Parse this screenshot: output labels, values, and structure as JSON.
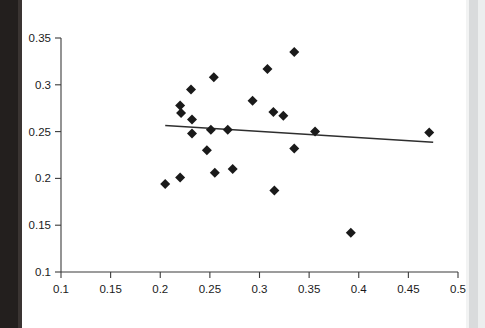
{
  "chart_data": {
    "type": "scatter",
    "title": "",
    "subtitle": "",
    "xlabel": "",
    "ylabel": "",
    "xlim": [
      0.1,
      0.5
    ],
    "ylim": [
      0.1,
      0.35
    ],
    "grid": false,
    "legend": null,
    "marker_shape": "diamond",
    "marker_color": "#1a1a1a",
    "trendline_color": "#2e2e2e",
    "xticks": [
      0.1,
      0.15,
      0.2,
      0.25,
      0.3,
      0.35,
      0.4,
      0.45,
      0.5
    ],
    "yticks": [
      0.1,
      0.15,
      0.2,
      0.25,
      0.3,
      0.35
    ],
    "xtick_labels": [
      "0.1",
      "0.15",
      "0.2",
      "0.25",
      "0.3",
      "0.35",
      "0.4",
      "0.45",
      "0.5"
    ],
    "ytick_labels": [
      "0.1",
      "0.15",
      "0.2",
      "0.25",
      "0.3",
      "0.35"
    ],
    "points": [
      {
        "x": 0.205,
        "y": 0.194
      },
      {
        "x": 0.22,
        "y": 0.201
      },
      {
        "x": 0.22,
        "y": 0.278
      },
      {
        "x": 0.221,
        "y": 0.27
      },
      {
        "x": 0.231,
        "y": 0.295
      },
      {
        "x": 0.232,
        "y": 0.263
      },
      {
        "x": 0.232,
        "y": 0.248
      },
      {
        "x": 0.247,
        "y": 0.23
      },
      {
        "x": 0.251,
        "y": 0.252
      },
      {
        "x": 0.254,
        "y": 0.308
      },
      {
        "x": 0.255,
        "y": 0.206
      },
      {
        "x": 0.268,
        "y": 0.252
      },
      {
        "x": 0.273,
        "y": 0.21
      },
      {
        "x": 0.293,
        "y": 0.283
      },
      {
        "x": 0.308,
        "y": 0.317
      },
      {
        "x": 0.314,
        "y": 0.271
      },
      {
        "x": 0.315,
        "y": 0.187
      },
      {
        "x": 0.324,
        "y": 0.267
      },
      {
        "x": 0.335,
        "y": 0.335
      },
      {
        "x": 0.335,
        "y": 0.232
      },
      {
        "x": 0.356,
        "y": 0.25
      },
      {
        "x": 0.392,
        "y": 0.142
      },
      {
        "x": 0.471,
        "y": 0.249
      }
    ],
    "trendline": {
      "x_start": 0.205,
      "y_start": 0.2565,
      "x_end": 0.475,
      "y_end": 0.2385
    }
  },
  "figure": {
    "background_color": "#ffffff",
    "left_strip_color": "#231f1e",
    "right_strip_color": "#d9dbdc"
  }
}
